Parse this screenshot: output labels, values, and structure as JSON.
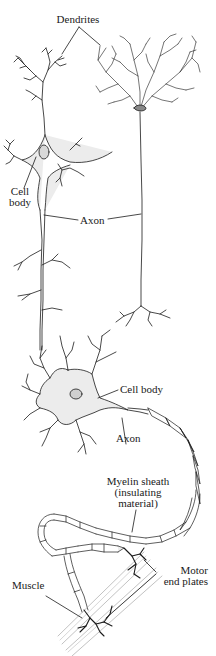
{
  "figure": {
    "top_panel": {
      "labels": {
        "dendrites": "Dendrites",
        "cell_body_line1": "Cell",
        "cell_body_line2": "body",
        "axon": "Axon"
      }
    },
    "bottom_panel": {
      "labels": {
        "cell_body": "Cell body",
        "axon": "Axon",
        "myelin_line1": "Myelin sheath",
        "myelin_line2": "(insulating",
        "myelin_line3": "material)",
        "motor_line1": "Motor",
        "motor_line2": "end plates",
        "muscle": "Muscle"
      }
    },
    "colors": {
      "ink": "#1a1a1a",
      "stipple": "#e6e6e6",
      "background": "#ffffff"
    }
  }
}
